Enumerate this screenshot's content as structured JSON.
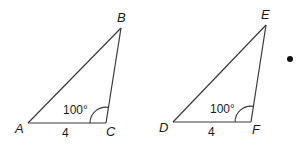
{
  "diagram": {
    "triangles": [
      {
        "name": "ABC",
        "vertices": {
          "A": "A",
          "B": "B",
          "C": "C"
        },
        "angle_label": "100°",
        "angle_at": "C",
        "side_label": "4",
        "side": "AC"
      },
      {
        "name": "DEF",
        "vertices": {
          "D": "D",
          "E": "E",
          "F": "F"
        },
        "angle_label": "100°",
        "angle_at": "F",
        "side_label": "4",
        "side": "DF"
      }
    ],
    "colors": {
      "stroke": "#3a3a3a",
      "text": "#1a1a1a",
      "dot": "#111111"
    }
  }
}
